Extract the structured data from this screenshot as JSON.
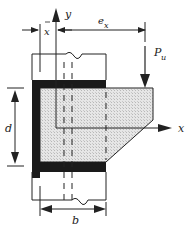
{
  "diagram": {
    "type": "structural-connection",
    "labels": {
      "y_axis": "y",
      "x_axis": "x",
      "xbar_base": "x",
      "ex_base": "e",
      "ex_sub": "x",
      "load_base": "P",
      "load_sub": "u",
      "depth": "d",
      "width": "b"
    },
    "colors": {
      "angle_fill": "#1a1a1a",
      "plate_fill": "#dcdcdc",
      "line": "#222222",
      "background": "#ffffff"
    }
  }
}
